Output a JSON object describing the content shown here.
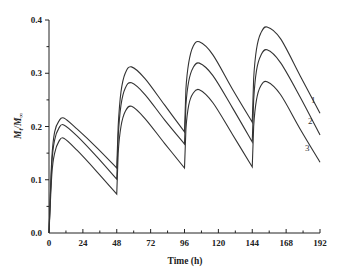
{
  "chart_data": {
    "type": "line",
    "title": "",
    "xlabel": "Time (h)",
    "ylabel": "Mt/M∞",
    "ylabel_parts": {
      "main": "M",
      "sub1": "t",
      "slash": "/M",
      "sub2": "∞"
    },
    "xlim": [
      0,
      192
    ],
    "ylim": [
      0.0,
      0.4
    ],
    "x_ticks": [
      0,
      24,
      48,
      72,
      96,
      120,
      144,
      168,
      192
    ],
    "x_tick_labels": [
      "0",
      "24",
      "48",
      "72",
      "96",
      "120",
      "144",
      "168",
      "192"
    ],
    "y_ticks": [
      0.0,
      0.1,
      0.2,
      0.3,
      0.4
    ],
    "y_tick_labels": [
      "0.0",
      "0.1",
      "0.2",
      "0.3",
      "0.4"
    ],
    "grid": false,
    "legend": "inline labels at right end of curves",
    "dosing_times_h": [
      0,
      48,
      96,
      144
    ],
    "series": [
      {
        "name": "1",
        "label": "1",
        "points": [
          [
            0,
            0.0
          ],
          [
            2,
            0.14
          ],
          [
            4,
            0.19
          ],
          [
            7,
            0.21
          ],
          [
            10.5,
            0.216
          ],
          [
            20,
            0.195
          ],
          [
            34,
            0.16
          ],
          [
            48,
            0.122
          ],
          [
            49,
            0.2
          ],
          [
            51,
            0.265
          ],
          [
            54,
            0.3
          ],
          [
            58.5,
            0.312
          ],
          [
            68,
            0.29
          ],
          [
            82,
            0.24
          ],
          [
            96,
            0.19
          ],
          [
            97,
            0.27
          ],
          [
            99,
            0.32
          ],
          [
            102,
            0.35
          ],
          [
            106.5,
            0.359
          ],
          [
            116,
            0.335
          ],
          [
            130,
            0.27
          ],
          [
            144,
            0.208
          ],
          [
            145,
            0.29
          ],
          [
            147,
            0.345
          ],
          [
            150,
            0.375
          ],
          [
            154.5,
            0.387
          ],
          [
            164,
            0.365
          ],
          [
            178,
            0.295
          ],
          [
            192,
            0.225
          ]
        ]
      },
      {
        "name": "2",
        "label": "2",
        "points": [
          [
            0,
            0.0
          ],
          [
            2,
            0.13
          ],
          [
            4,
            0.175
          ],
          [
            7,
            0.197
          ],
          [
            10.5,
            0.203
          ],
          [
            20,
            0.182
          ],
          [
            34,
            0.143
          ],
          [
            48,
            0.101
          ],
          [
            49,
            0.18
          ],
          [
            51,
            0.24
          ],
          [
            54,
            0.272
          ],
          [
            58.5,
            0.282
          ],
          [
            68,
            0.26
          ],
          [
            82,
            0.212
          ],
          [
            96,
            0.167
          ],
          [
            97,
            0.24
          ],
          [
            99,
            0.285
          ],
          [
            102,
            0.31
          ],
          [
            106.5,
            0.319
          ],
          [
            116,
            0.296
          ],
          [
            130,
            0.235
          ],
          [
            144,
            0.171
          ],
          [
            145,
            0.25
          ],
          [
            147,
            0.305
          ],
          [
            150,
            0.333
          ],
          [
            154.5,
            0.344
          ],
          [
            164,
            0.32
          ],
          [
            178,
            0.255
          ],
          [
            192,
            0.184
          ]
        ]
      },
      {
        "name": "3",
        "label": "3",
        "points": [
          [
            0,
            0.0
          ],
          [
            2,
            0.11
          ],
          [
            4,
            0.15
          ],
          [
            7,
            0.172
          ],
          [
            10.5,
            0.178
          ],
          [
            20,
            0.155
          ],
          [
            34,
            0.115
          ],
          [
            48,
            0.073
          ],
          [
            49,
            0.15
          ],
          [
            51,
            0.2
          ],
          [
            54,
            0.228
          ],
          [
            58.5,
            0.238
          ],
          [
            68,
            0.215
          ],
          [
            82,
            0.168
          ],
          [
            96,
            0.122
          ],
          [
            97,
            0.195
          ],
          [
            99,
            0.24
          ],
          [
            102,
            0.262
          ],
          [
            106.5,
            0.269
          ],
          [
            116,
            0.245
          ],
          [
            130,
            0.185
          ],
          [
            144,
            0.124
          ],
          [
            145,
            0.2
          ],
          [
            147,
            0.25
          ],
          [
            150,
            0.276
          ],
          [
            154.5,
            0.284
          ],
          [
            164,
            0.26
          ],
          [
            178,
            0.195
          ],
          [
            192,
            0.133
          ]
        ]
      }
    ],
    "curve_label_positions": [
      {
        "label": "1",
        "x_px": 311,
        "y_px": 103
      },
      {
        "label": "2",
        "x_px": 308,
        "y_px": 124
      },
      {
        "label": "3",
        "x_px": 305,
        "y_px": 151
      }
    ]
  },
  "colors": {
    "background": "#ffffff",
    "axis": "#222222",
    "curve": "#333333"
  }
}
